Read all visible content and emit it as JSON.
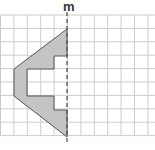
{
  "diagram": {
    "type": "grid-symmetry",
    "line_label": "m",
    "grid": {
      "cols": 11,
      "rows": 9,
      "cell": 13.4,
      "origin_x": 0.5,
      "origin_y": 15,
      "line_color": "#cccccc"
    },
    "shape": {
      "fill": "#c4c4c4",
      "stroke": "#555555",
      "points": [
        [
          67,
          29
        ],
        [
          14,
          69
        ],
        [
          14,
          96
        ],
        [
          67,
          137
        ],
        [
          67,
          110
        ],
        [
          54,
          110
        ],
        [
          54,
          96
        ],
        [
          27,
          96
        ],
        [
          27,
          69
        ],
        [
          54,
          69
        ],
        [
          54,
          56
        ],
        [
          67,
          56
        ]
      ]
    },
    "symmetry_line": {
      "x": 67,
      "y1": 12,
      "y2": 142,
      "color": "#555555",
      "dashed": true
    }
  }
}
